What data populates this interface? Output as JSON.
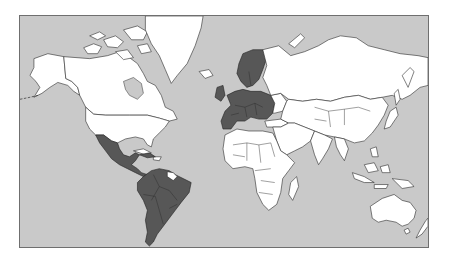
{
  "map": {
    "type": "world-choropleth",
    "projection": "mercator",
    "colors": {
      "ocean": "#c9c9c9",
      "land_default": "#ffffff",
      "land_highlighted": "#575757",
      "borders": "#2b2b2b",
      "frame": "#6f6f6f"
    },
    "highlighted_regions": [
      {
        "name": "Europe",
        "color": "#575757"
      },
      {
        "name": "Latin America",
        "color": "#575757"
      }
    ],
    "unhighlighted_regions": [
      "North America (Canada, USA)",
      "Greenland",
      "Africa",
      "Russia",
      "Asia",
      "Middle East",
      "Australia",
      "New Zealand",
      "Indonesia"
    ]
  }
}
